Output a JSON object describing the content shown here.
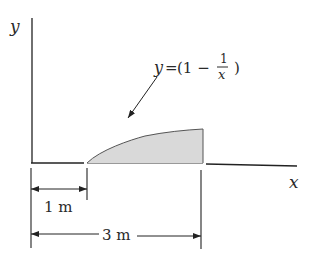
{
  "figure": {
    "axes": {
      "x_label": "x",
      "y_label": "y"
    },
    "curve": {
      "equation_lhs": "y",
      "equation_eq": "=",
      "equation_open": "(1 −",
      "equation_num": "1",
      "equation_den": "x",
      "equation_close": ")",
      "function": "y = 1 - 1/x",
      "x_start": 1,
      "x_end": 3,
      "fill_color": "#d9d9d9",
      "stroke_color": "#555555"
    },
    "dimensions": [
      {
        "label": "1 m",
        "from": 0,
        "to": 1
      },
      {
        "label": "3 m",
        "from": 0,
        "to": 3
      }
    ]
  }
}
